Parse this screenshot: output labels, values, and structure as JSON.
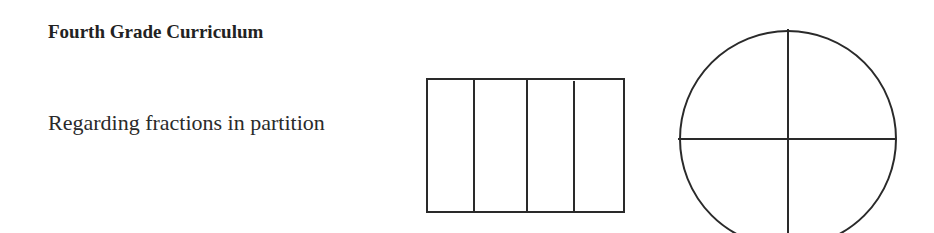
{
  "document": {
    "title": "Fourth Grade Curriculum",
    "subtitle": "Regarding fractions in partition"
  },
  "figures": [
    {
      "name": "rectangle-partitioned-fourths",
      "shape": "rectangle",
      "parts": 4,
      "partition": "vertical lines"
    },
    {
      "name": "circle-partitioned-fourths",
      "shape": "circle",
      "parts": 4,
      "partition": "horizontal and vertical diameters"
    }
  ],
  "colors": {
    "stroke": "#2a2a2a",
    "background": "#ffffff",
    "text": "#222222"
  }
}
